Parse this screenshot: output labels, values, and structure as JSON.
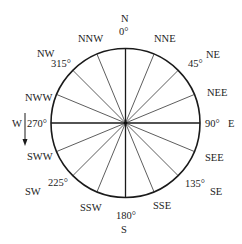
{
  "diagram": {
    "directions": [
      {
        "name": "N",
        "bearing_deg": 0
      },
      {
        "name": "NNE",
        "bearing_deg": 22.5
      },
      {
        "name": "NE",
        "bearing_deg": 45
      },
      {
        "name": "NEE",
        "bearing_deg": 67.5
      },
      {
        "name": "E",
        "bearing_deg": 90
      },
      {
        "name": "SEE",
        "bearing_deg": 112.5
      },
      {
        "name": "SE",
        "bearing_deg": 135
      },
      {
        "name": "SSE",
        "bearing_deg": 157.5
      },
      {
        "name": "S",
        "bearing_deg": 180
      },
      {
        "name": "SSW",
        "bearing_deg": 202.5
      },
      {
        "name": "SW",
        "bearing_deg": 225
      },
      {
        "name": "SWW",
        "bearing_deg": 247.5
      },
      {
        "name": "W",
        "bearing_deg": 270
      },
      {
        "name": "NWW",
        "bearing_deg": 292.5
      },
      {
        "name": "NW",
        "bearing_deg": 315
      },
      {
        "name": "NNW",
        "bearing_deg": 337.5
      }
    ],
    "degree_labels": [
      {
        "text": "0°",
        "bearing_deg": 0
      },
      {
        "text": "45°",
        "bearing_deg": 45
      },
      {
        "text": "90°",
        "bearing_deg": 90
      },
      {
        "text": "135°",
        "bearing_deg": 135
      },
      {
        "text": "180°",
        "bearing_deg": 180
      },
      {
        "text": "225°",
        "bearing_deg": 225
      },
      {
        "text": "270°",
        "bearing_deg": 270
      },
      {
        "text": "315°",
        "bearing_deg": 315
      }
    ],
    "labels": {
      "N": "N",
      "NNE": "NNE",
      "NE": "NE",
      "NEE": "NEE",
      "E": "E",
      "SEE": "SEE",
      "SE": "SE",
      "SSE": "SSE",
      "S": "S",
      "SSW": "SSW",
      "SW": "SW",
      "SWW": "SWW",
      "W": "W",
      "NWW": "NWW",
      "NW": "NW",
      "NNW": "NNW",
      "deg0": "0°",
      "deg45": "45°",
      "deg90": "90°",
      "deg135": "135°",
      "deg180": "180°",
      "deg225": "225°",
      "deg270": "270°",
      "deg315": "315°"
    },
    "arrow": {
      "description": "downward arrow beside W indicating direction",
      "direction": "down"
    },
    "colors": {
      "ink": "#1a1a1a",
      "background": "#ffffff"
    }
  }
}
